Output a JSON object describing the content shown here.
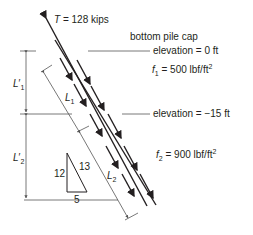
{
  "diagram": {
    "force": {
      "symbol": "T",
      "eq": " = ",
      "value": "128 kips"
    },
    "cap_label": "bottom pile cap",
    "elev1": "elevation = 0 ft",
    "f1": {
      "symbol": "f",
      "sub": "1",
      "rest": " = 500 lbf/ft",
      "sup": "2"
    },
    "elev2": "elevation = −15 ft",
    "f2": {
      "symbol": "f",
      "sub": "2",
      "rest": " = 900 lbf/ft",
      "sup": "2"
    },
    "L1prime": {
      "symbol": "L",
      "prime": "′",
      "sub": "1"
    },
    "L2prime": {
      "symbol": "L",
      "prime": "′",
      "sub": "2"
    },
    "L1": {
      "symbol": "L",
      "sub": "1"
    },
    "L2": {
      "symbol": "L",
      "sub": "2"
    },
    "slope": {
      "vertical": "12",
      "hypotenuse": "13",
      "horizontal": "5"
    },
    "colors": {
      "ink": "#231f20",
      "dim": "#555555"
    }
  }
}
